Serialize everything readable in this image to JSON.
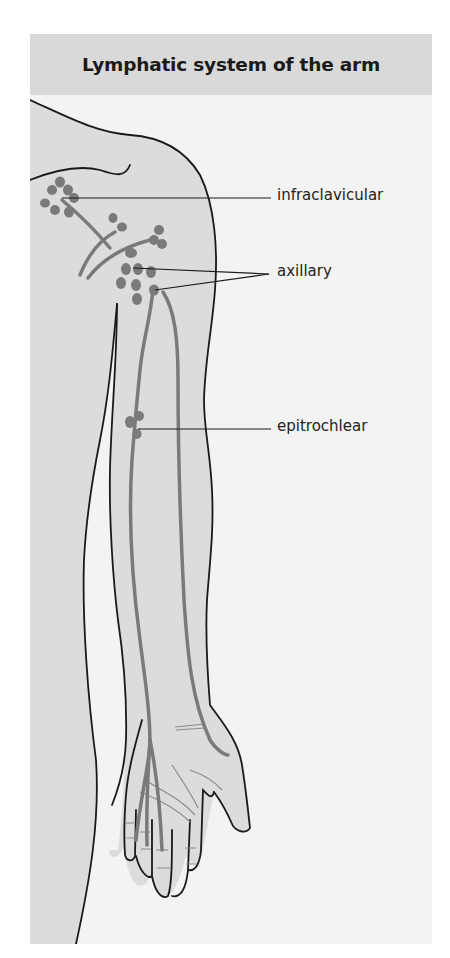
{
  "diagram": {
    "title": "Lymphatic system of the arm",
    "labels": {
      "infraclavicular": "infraclavicular",
      "axillary": "axillary",
      "epitrochlear": "epitrochlear"
    },
    "colors": {
      "header_bg": "#d9d9d9",
      "panel_bg": "#f3f3f3",
      "body_fill": "#dcdcdc",
      "lymph": "#7a7a7a",
      "outline": "#1a1a1a"
    }
  }
}
